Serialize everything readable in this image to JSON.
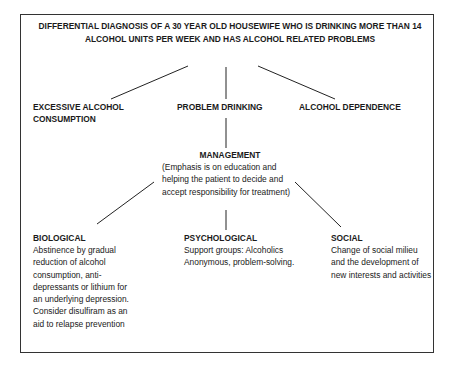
{
  "title": "DIFFERENTIAL DIAGNOSIS OF A 30 YEAR OLD HOUSEWIFE WHO IS DRINKING MORE THAN 14 ALCOHOL UNITS PER WEEK AND HAS ALCOHOL RELATED PROBLEMS",
  "diagnoses": [
    {
      "label": "EXCESSIVE ALCOHOL CONSUMPTION"
    },
    {
      "label": "PROBLEM DRINKING"
    },
    {
      "label": "ALCOHOL DEPENDENCE"
    }
  ],
  "management": {
    "label": "MANAGEMENT",
    "note": "(Emphasis is on education and helping the patient to decide and accept responsibility for treatment)"
  },
  "branches": [
    {
      "label": "BIOLOGICAL",
      "text": "Abstinence by gradual reduction of alcohol consumption, anti-depressants or lithium for an underlying depression. Consider disulfiram as an aid to relapse prevention"
    },
    {
      "label": "PSYCHOLOGICAL",
      "text": "Support groups: Alcoholics Anonymous, problem-solving."
    },
    {
      "label": "SOCIAL",
      "text": "Change of social milieu and the development of new interests and activities"
    }
  ]
}
